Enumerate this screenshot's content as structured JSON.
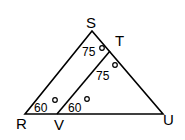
{
  "diagram": {
    "points": {
      "S": "S",
      "T": "T",
      "R": "R",
      "V": "V",
      "U": "U"
    },
    "angles": {
      "sr_top": "75",
      "tv_top": "75",
      "r_angle": "60",
      "v_angle": "60"
    },
    "degree_symbol": "o"
  }
}
